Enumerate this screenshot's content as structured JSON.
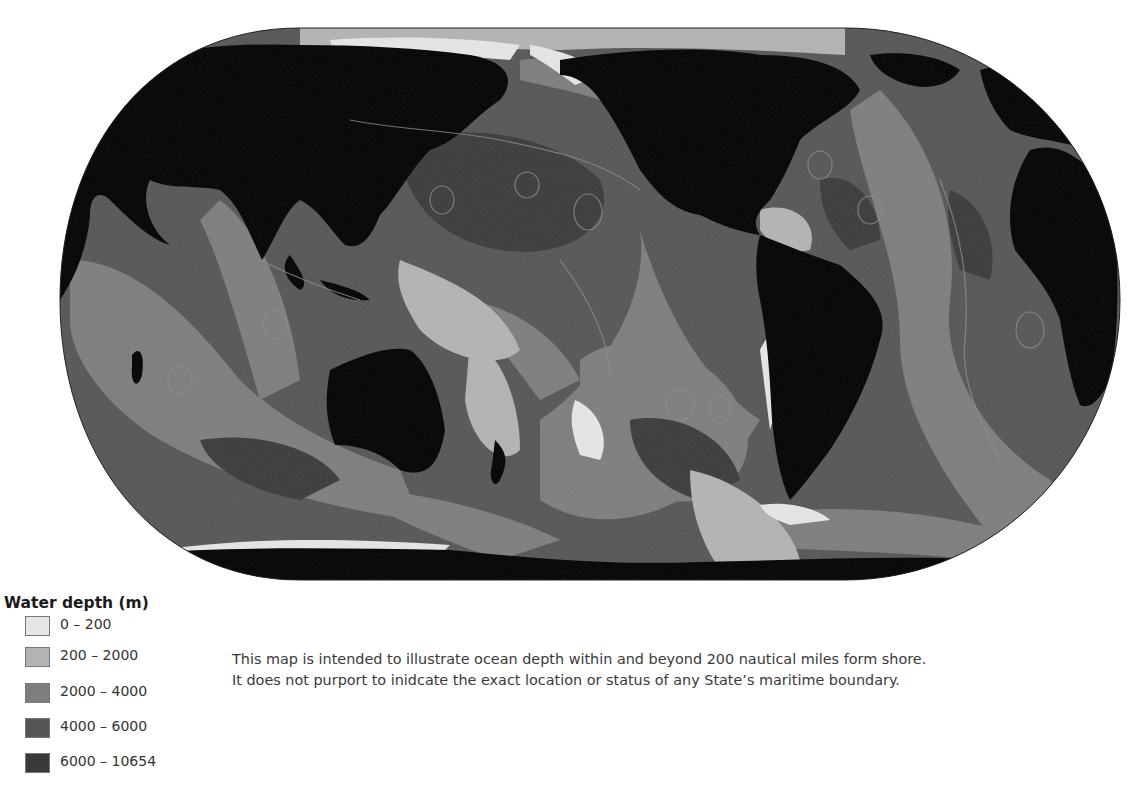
{
  "map": {
    "projection": "Pacific-centered world map (pseudo-cylindrical, rounded outline)",
    "colors": {
      "land": "#000000",
      "depth_0_200": "#e6e6e6",
      "depth_200_2000": "#b3b3b3",
      "depth_2000_4000": "#7d7d7d",
      "depth_4000_6000": "#555555",
      "depth_6000_10654": "#3a3a3a",
      "boundary_lines": "#8a8a8a"
    },
    "regions_visible": [
      "Asia",
      "Europe",
      "Africa",
      "Australia",
      "North America",
      "South America",
      "Antarctica",
      "Pacific Ocean",
      "Atlantic Ocean",
      "Indian Ocean"
    ]
  },
  "legend": {
    "title": "Water depth (m)",
    "items": [
      {
        "label": "0 – 200",
        "color": "#e6e6e6"
      },
      {
        "label": "200 – 2000",
        "color": "#b3b3b3"
      },
      {
        "label": "2000 – 4000",
        "color": "#7d7d7d"
      },
      {
        "label": "4000 – 6000",
        "color": "#555555"
      },
      {
        "label": "6000 – 10654",
        "color": "#3a3a3a"
      }
    ]
  },
  "caption": {
    "line1": "This map is intended to illustrate ocean depth within and beyond 200 nautical miles form shore.",
    "line2": "It does not purport to inidcate the exact location or status of any State’s maritime boundary."
  }
}
